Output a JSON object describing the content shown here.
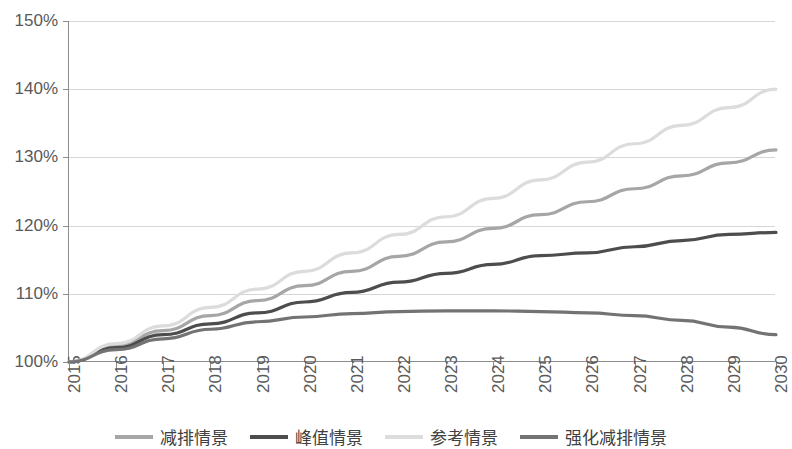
{
  "chart_data": {
    "type": "line",
    "title": "",
    "xlabel": "",
    "ylabel": "",
    "categories": [
      "2015",
      "2016",
      "2017",
      "2018",
      "2019",
      "2020",
      "2021",
      "2022",
      "2023",
      "2024",
      "2025",
      "2026",
      "2027",
      "2028",
      "2029",
      "2030"
    ],
    "x": [
      2015,
      2016,
      2017,
      2018,
      2019,
      2020,
      2021,
      2022,
      2023,
      2024,
      2025,
      2026,
      2027,
      2028,
      2029,
      2030
    ],
    "ylim": [
      100,
      150
    ],
    "yticks": [
      "100%",
      "110%",
      "120%",
      "130%",
      "140%",
      "150%"
    ],
    "ytick_values": [
      100,
      110,
      120,
      130,
      140,
      150
    ],
    "grid": true,
    "legend_position": "bottom",
    "series": [
      {
        "name": "减排情景",
        "color": "#a6a6a6",
        "values": [
          100.0,
          102.4,
          104.6,
          106.8,
          109.0,
          111.2,
          113.3,
          115.5,
          117.6,
          119.6,
          121.6,
          123.5,
          125.4,
          127.3,
          129.2,
          131.1
        ]
      },
      {
        "name": "峰值情景",
        "color": "#4d4d4d",
        "values": [
          100.0,
          102.1,
          104.0,
          105.6,
          107.2,
          108.8,
          110.2,
          111.7,
          113.0,
          114.3,
          115.6,
          116.0,
          116.9,
          117.8,
          118.7,
          119.0
        ]
      },
      {
        "name": "参考情景",
        "color": "#dcdcdc",
        "values": [
          100.0,
          102.7,
          105.3,
          108.0,
          110.7,
          113.3,
          116.0,
          118.7,
          121.3,
          124.0,
          126.7,
          129.3,
          132.0,
          134.7,
          137.3,
          140.0
        ]
      },
      {
        "name": "强化减排情景",
        "color": "#737373",
        "values": [
          100.0,
          101.8,
          103.4,
          104.8,
          105.9,
          106.6,
          107.1,
          107.4,
          107.5,
          107.5,
          107.4,
          107.2,
          106.8,
          106.1,
          105.1,
          104.0
        ]
      }
    ]
  },
  "legend": {
    "items": [
      {
        "label": "减排情景",
        "color": "#a6a6a6"
      },
      {
        "label": "峰值情景",
        "color": "#4d4d4d"
      },
      {
        "label": "参考情景",
        "color": "#dcdcdc"
      },
      {
        "label": "强化减排情景",
        "color": "#737373"
      }
    ]
  },
  "axes": {
    "y_labels": [
      "150%",
      "140%",
      "130%",
      "120%",
      "110%",
      "100%"
    ],
    "x_labels": [
      "2015",
      "2016",
      "2017",
      "2018",
      "2019",
      "2020",
      "2021",
      "2022",
      "2023",
      "2024",
      "2025",
      "2026",
      "2027",
      "2028",
      "2029",
      "2030"
    ]
  },
  "colors": {
    "axis": "#8c8c8c",
    "grid": "#d6d6d6",
    "tick_text": "#595959",
    "legend_text": "#404040",
    "background": "#ffffff"
  }
}
